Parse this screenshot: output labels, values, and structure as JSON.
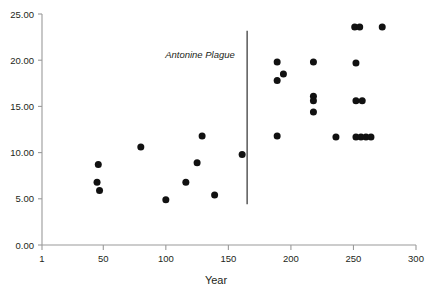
{
  "chart_data": {
    "type": "scatter",
    "title": "",
    "xlabel": "Year",
    "ylabel": "",
    "xlim": [
      1,
      300
    ],
    "ylim": [
      0,
      25
    ],
    "grid": false,
    "legend": null,
    "xticks": [
      "1",
      "50",
      "100",
      "150",
      "200",
      "250",
      "300"
    ],
    "xtick_values": [
      1,
      50,
      100,
      150,
      200,
      250,
      300
    ],
    "yticks": [
      "0.00",
      "5.00",
      "10.00",
      "15.00",
      "20.00",
      "25.00"
    ],
    "ytick_values": [
      0,
      5,
      10,
      15,
      20,
      25
    ],
    "marker_color": "#111111",
    "annotations": [
      {
        "text": "Antonine Plague",
        "type": "vertical-line-with-label",
        "x": 165,
        "y_top": 23.2,
        "y_bottom": 4.4,
        "label_x": 160,
        "label_y": 20.2,
        "line_color": "#4d4d4d"
      }
    ],
    "points": [
      {
        "x": 46,
        "y": 8.7
      },
      {
        "x": 45,
        "y": 6.8
      },
      {
        "x": 47,
        "y": 5.9
      },
      {
        "x": 80,
        "y": 10.6
      },
      {
        "x": 100,
        "y": 4.9
      },
      {
        "x": 116,
        "y": 6.8
      },
      {
        "x": 125,
        "y": 8.9
      },
      {
        "x": 129,
        "y": 11.8
      },
      {
        "x": 139,
        "y": 5.4
      },
      {
        "x": 161,
        "y": 9.8
      },
      {
        "x": 189,
        "y": 19.8
      },
      {
        "x": 189,
        "y": 17.8
      },
      {
        "x": 194,
        "y": 18.5
      },
      {
        "x": 189,
        "y": 11.8
      },
      {
        "x": 218,
        "y": 19.8
      },
      {
        "x": 218,
        "y": 16.1
      },
      {
        "x": 218,
        "y": 15.6
      },
      {
        "x": 218,
        "y": 14.4
      },
      {
        "x": 236,
        "y": 11.7
      },
      {
        "x": 251,
        "y": 23.6
      },
      {
        "x": 255,
        "y": 23.6
      },
      {
        "x": 273,
        "y": 23.6
      },
      {
        "x": 252,
        "y": 19.7
      },
      {
        "x": 252,
        "y": 15.6
      },
      {
        "x": 257,
        "y": 15.6
      },
      {
        "x": 252,
        "y": 11.7
      },
      {
        "x": 256,
        "y": 11.7
      },
      {
        "x": 260,
        "y": 11.7
      },
      {
        "x": 264,
        "y": 11.7
      }
    ]
  }
}
